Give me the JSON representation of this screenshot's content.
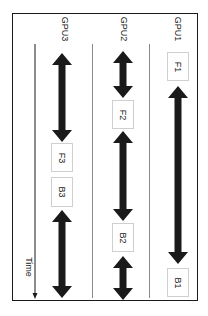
{
  "diagram": {
    "lanes": [
      {
        "label": "GPU1",
        "x": 178
      },
      {
        "label": "GPU2",
        "x": 123
      },
      {
        "label": "GPU3",
        "x": 62
      }
    ],
    "time_label": "Time",
    "boxes": [
      {
        "id": "F1",
        "label": "F1",
        "lane": "GPU1"
      },
      {
        "id": "B1",
        "label": "B1",
        "lane": "GPU1"
      },
      {
        "id": "F2",
        "label": "F2",
        "lane": "GPU2"
      },
      {
        "id": "B2",
        "label": "B2",
        "lane": "GPU2"
      },
      {
        "id": "F3",
        "label": "F3",
        "lane": "GPU3"
      },
      {
        "id": "B3",
        "label": "B3",
        "lane": "GPU3"
      }
    ],
    "arrows": [
      {
        "lane": "GPU1",
        "from_y": 86,
        "to_y": 264,
        "type": "double"
      },
      {
        "lane": "GPU2",
        "from_y": 51,
        "to_y": 98,
        "type": "double"
      },
      {
        "lane": "GPU2",
        "from_y": 131,
        "to_y": 221,
        "type": "double"
      },
      {
        "lane": "GPU2",
        "from_y": 256,
        "to_y": 300,
        "type": "double"
      },
      {
        "lane": "GPU3",
        "from_y": 53,
        "to_y": 142,
        "type": "double"
      },
      {
        "lane": "GPU3",
        "from_y": 210,
        "to_y": 298,
        "type": "double"
      }
    ],
    "colors": {
      "arrow": "#1a1a1a",
      "border": "#1a1a1a",
      "separator": "#8a8a8a",
      "box_border": "#cfcfcf"
    }
  }
}
